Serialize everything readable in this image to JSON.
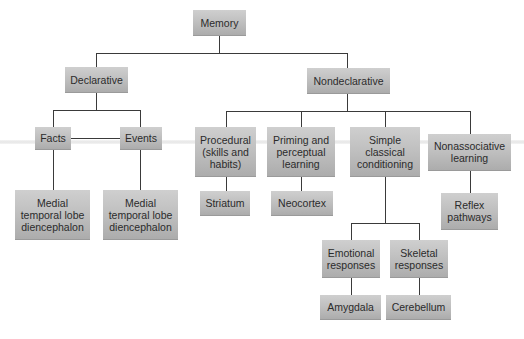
{
  "diagram": {
    "nodes": {
      "memory": "Memory",
      "declarative": "Declarative",
      "nondeclarative": "Nondeclarative",
      "facts": "Facts",
      "events": "Events",
      "facts_brain": "Medial\ntemporal lobe\ndiencephalon",
      "events_brain": "Medial\ntemporal lobe\ndiencephalon",
      "procedural": "Procedural\n(skills and\nhabits)",
      "priming": "Priming and\nperceptual\nlearning",
      "simple": "Simple\nclassical\nconditioning",
      "nonassociative": "Nonassociative\nlearning",
      "striatum": "Striatum",
      "neocortex": "Neocortex",
      "reflex": "Reflex\npathways",
      "emotional": "Emotional\nresponses",
      "skeletal": "Skeletal\nresponses",
      "amygdala": "Amygdala",
      "cerebellum": "Cerebellum"
    },
    "edges": [
      [
        "memory",
        "declarative"
      ],
      [
        "memory",
        "nondeclarative"
      ],
      [
        "declarative",
        "facts"
      ],
      [
        "declarative",
        "events"
      ],
      [
        "facts",
        "facts_brain"
      ],
      [
        "events",
        "events_brain"
      ],
      [
        "nondeclarative",
        "procedural"
      ],
      [
        "nondeclarative",
        "priming"
      ],
      [
        "nondeclarative",
        "simple"
      ],
      [
        "nondeclarative",
        "nonassociative"
      ],
      [
        "procedural",
        "striatum"
      ],
      [
        "priming",
        "neocortex"
      ],
      [
        "simple",
        "emotional"
      ],
      [
        "simple",
        "skeletal"
      ],
      [
        "nonassociative",
        "reflex"
      ],
      [
        "emotional",
        "amygdala"
      ],
      [
        "skeletal",
        "cerebellum"
      ]
    ],
    "colors": {
      "box_top": "#cfcfcf",
      "box_bottom": "#acacac",
      "line": "#3a3a3a",
      "text": "#2b2b2b"
    }
  }
}
